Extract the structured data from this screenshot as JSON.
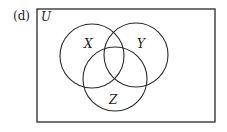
{
  "figure": {
    "panel_label": "(d)",
    "universe_label": "U",
    "sets": [
      {
        "name": "X",
        "cx": 92,
        "cy": 56,
        "r": 32,
        "label_x": 88,
        "label_y": 48
      },
      {
        "name": "Y",
        "cx": 136,
        "cy": 55,
        "r": 32,
        "label_x": 141,
        "label_y": 48
      },
      {
        "name": "Z",
        "cx": 115,
        "cy": 79,
        "r": 32,
        "label_x": 113,
        "label_y": 104
      }
    ],
    "stroke_color": "#2a2a2a"
  }
}
